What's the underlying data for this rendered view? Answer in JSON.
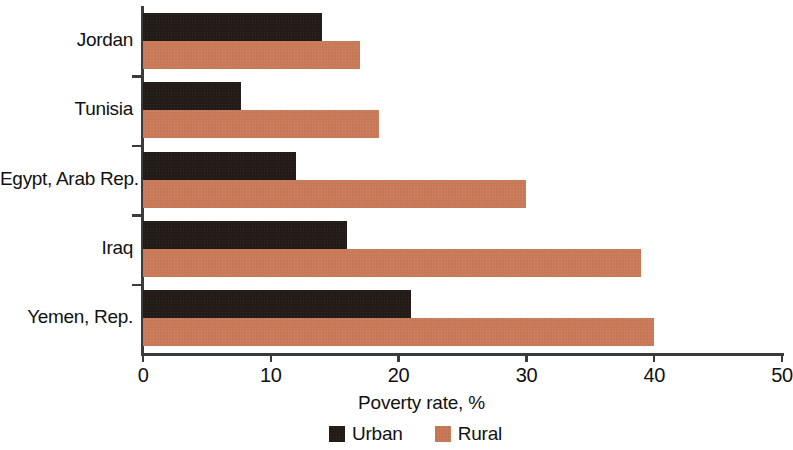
{
  "chart_data": {
    "type": "bar",
    "orientation": "horizontal",
    "title": "",
    "xlabel": "Poverty rate, %",
    "ylabel": "",
    "xlim": [
      0,
      50
    ],
    "xticks": [
      0,
      10,
      20,
      30,
      40,
      50
    ],
    "grid": false,
    "legend_position": "bottom",
    "categories": [
      "Jordan",
      "Tunisia",
      "Egypt, Arab Rep.",
      "Iraq",
      "Yemen, Rep."
    ],
    "series": [
      {
        "name": "Urban",
        "color": "#231b17",
        "values": [
          14.0,
          7.7,
          12.0,
          16.0,
          21.0
        ]
      },
      {
        "name": "Rural",
        "color": "#c87a58",
        "values": [
          17.0,
          18.5,
          30.0,
          39.0,
          40.0
        ]
      }
    ]
  },
  "axis": {
    "x_title": "Poverty rate, %",
    "tick_labels": [
      "0",
      "10",
      "20",
      "30",
      "40",
      "50"
    ]
  },
  "legend": {
    "items": [
      {
        "label": "Urban",
        "swatch": "urban-swatch"
      },
      {
        "label": "Rural",
        "swatch": "rural-swatch"
      }
    ]
  }
}
